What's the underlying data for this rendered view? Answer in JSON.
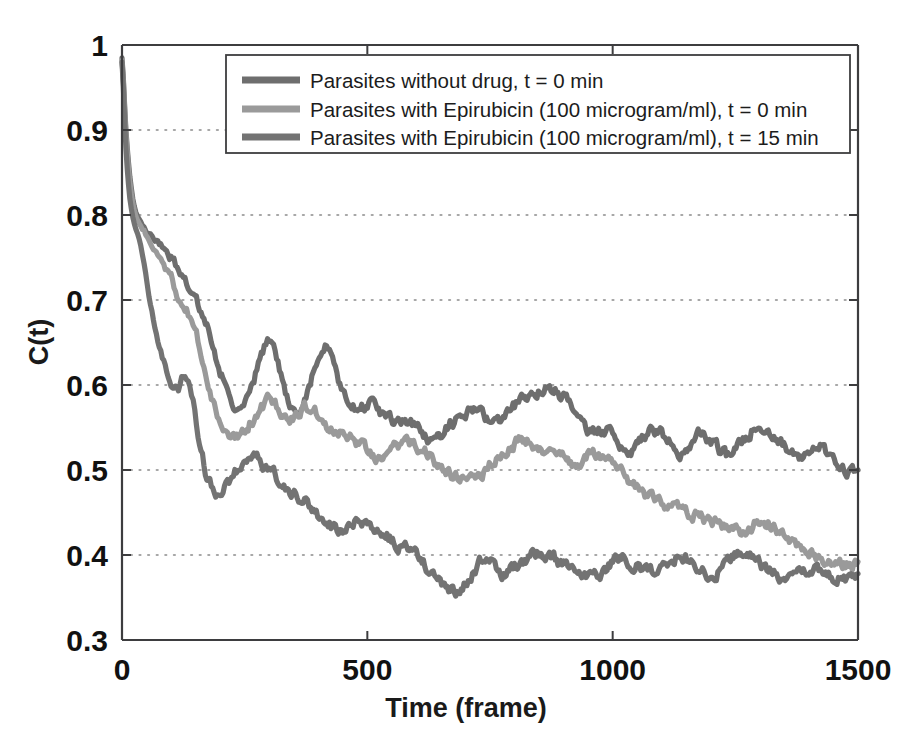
{
  "chart_data": {
    "type": "line",
    "title": "",
    "xlabel": "Time (frame)",
    "ylabel": "C(t)",
    "xlim": [
      0,
      1500
    ],
    "ylim": [
      0.3,
      1.0
    ],
    "xticks": [
      0,
      500,
      1000,
      1500
    ],
    "xtick_labels": [
      "0",
      "500",
      "1000",
      "1500"
    ],
    "yticks": [
      0.3,
      0.4,
      0.5,
      0.6,
      0.7,
      0.8,
      0.9,
      1.0
    ],
    "ytick_labels": [
      "0.3",
      "0.4",
      "0.5",
      "0.6",
      "0.7",
      "0.8",
      "0.9",
      "1"
    ],
    "grid": "horizontal-dotted",
    "legend_position": "top-center",
    "series": [
      {
        "name": "Parasites without drug, t = 0 min",
        "color": "#6e6e6e",
        "x": [
          0,
          8,
          16,
          25,
          35,
          45,
          55,
          70,
          85,
          100,
          115,
          125,
          135,
          145,
          155,
          170,
          185,
          200,
          215,
          230,
          245,
          260,
          275,
          290,
          300,
          315,
          330,
          345,
          360,
          375,
          390,
          405,
          420,
          435,
          450,
          465,
          480,
          500,
          520,
          540,
          560,
          580,
          600,
          620,
          640,
          660,
          680,
          700,
          720,
          740,
          760,
          780,
          800,
          820,
          840,
          860,
          880,
          900,
          920,
          940,
          960,
          980,
          1000,
          1020,
          1040,
          1060,
          1080,
          1100,
          1120,
          1140,
          1160,
          1180,
          1200,
          1220,
          1240,
          1260,
          1280,
          1300,
          1320,
          1340,
          1360,
          1380,
          1400,
          1420,
          1440,
          1460,
          1480,
          1500
        ],
        "y": [
          0.985,
          0.9,
          0.845,
          0.81,
          0.795,
          0.785,
          0.778,
          0.77,
          0.762,
          0.748,
          0.735,
          0.73,
          0.712,
          0.7,
          0.69,
          0.672,
          0.648,
          0.618,
          0.592,
          0.578,
          0.572,
          0.59,
          0.618,
          0.645,
          0.655,
          0.635,
          0.6,
          0.578,
          0.572,
          0.585,
          0.615,
          0.638,
          0.642,
          0.62,
          0.59,
          0.576,
          0.572,
          0.578,
          0.57,
          0.56,
          0.552,
          0.558,
          0.552,
          0.54,
          0.536,
          0.548,
          0.56,
          0.568,
          0.572,
          0.562,
          0.556,
          0.566,
          0.576,
          0.584,
          0.59,
          0.596,
          0.592,
          0.586,
          0.57,
          0.555,
          0.545,
          0.548,
          0.54,
          0.53,
          0.522,
          0.534,
          0.548,
          0.542,
          0.53,
          0.52,
          0.528,
          0.54,
          0.534,
          0.524,
          0.516,
          0.528,
          0.545,
          0.552,
          0.546,
          0.534,
          0.524,
          0.516,
          0.522,
          0.528,
          0.518,
          0.508,
          0.502,
          0.5
        ]
      },
      {
        "name": "Parasites with Epirubicin (100 microgram/ml), t = 0 min",
        "color": "#9a9a9a",
        "x": [
          0,
          8,
          16,
          25,
          35,
          45,
          55,
          70,
          85,
          100,
          115,
          125,
          135,
          145,
          155,
          170,
          185,
          200,
          215,
          230,
          245,
          260,
          275,
          290,
          300,
          315,
          330,
          345,
          360,
          375,
          390,
          405,
          420,
          435,
          450,
          465,
          480,
          500,
          520,
          540,
          560,
          580,
          600,
          620,
          640,
          660,
          680,
          700,
          720,
          740,
          760,
          780,
          800,
          820,
          840,
          860,
          880,
          900,
          920,
          940,
          960,
          980,
          1000,
          1020,
          1040,
          1060,
          1080,
          1100,
          1120,
          1140,
          1160,
          1180,
          1200,
          1220,
          1240,
          1260,
          1280,
          1300,
          1320,
          1340,
          1360,
          1380,
          1400,
          1420,
          1440,
          1460,
          1480,
          1500
        ],
        "y": [
          0.982,
          0.895,
          0.838,
          0.805,
          0.79,
          0.782,
          0.772,
          0.756,
          0.74,
          0.722,
          0.706,
          0.698,
          0.686,
          0.672,
          0.65,
          0.62,
          0.582,
          0.548,
          0.538,
          0.54,
          0.548,
          0.556,
          0.566,
          0.576,
          0.58,
          0.574,
          0.566,
          0.562,
          0.566,
          0.572,
          0.57,
          0.562,
          0.552,
          0.548,
          0.546,
          0.54,
          0.53,
          0.522,
          0.518,
          0.524,
          0.53,
          0.534,
          0.53,
          0.52,
          0.51,
          0.5,
          0.492,
          0.486,
          0.49,
          0.5,
          0.512,
          0.522,
          0.53,
          0.534,
          0.53,
          0.524,
          0.518,
          0.512,
          0.508,
          0.514,
          0.52,
          0.516,
          0.506,
          0.494,
          0.484,
          0.474,
          0.468,
          0.462,
          0.458,
          0.452,
          0.448,
          0.444,
          0.44,
          0.436,
          0.43,
          0.428,
          0.434,
          0.44,
          0.436,
          0.428,
          0.42,
          0.412,
          0.404,
          0.398,
          0.394,
          0.392,
          0.39,
          0.392
        ]
      },
      {
        "name": "Parasites with Epirubicin (100 microgram/ml), t = 15 min",
        "color": "#737373",
        "x": [
          0,
          8,
          16,
          25,
          35,
          45,
          55,
          70,
          85,
          100,
          115,
          125,
          135,
          145,
          155,
          170,
          185,
          200,
          215,
          230,
          245,
          260,
          275,
          290,
          300,
          315,
          330,
          345,
          360,
          375,
          390,
          405,
          420,
          435,
          450,
          465,
          480,
          500,
          520,
          540,
          560,
          580,
          600,
          620,
          640,
          660,
          680,
          700,
          720,
          740,
          760,
          780,
          800,
          820,
          840,
          860,
          880,
          900,
          920,
          940,
          960,
          980,
          1000,
          1020,
          1040,
          1060,
          1080,
          1100,
          1120,
          1140,
          1160,
          1180,
          1200,
          1220,
          1240,
          1260,
          1280,
          1300,
          1320,
          1340,
          1360,
          1380,
          1400,
          1420,
          1440,
          1460,
          1480,
          1500
        ],
        "y": [
          0.98,
          0.878,
          0.82,
          0.79,
          0.772,
          0.742,
          0.7,
          0.66,
          0.628,
          0.608,
          0.6,
          0.61,
          0.604,
          0.58,
          0.545,
          0.5,
          0.48,
          0.472,
          0.482,
          0.498,
          0.508,
          0.516,
          0.512,
          0.504,
          0.498,
          0.49,
          0.482,
          0.474,
          0.468,
          0.462,
          0.452,
          0.444,
          0.438,
          0.432,
          0.43,
          0.434,
          0.438,
          0.436,
          0.428,
          0.422,
          0.414,
          0.406,
          0.398,
          0.386,
          0.372,
          0.362,
          0.358,
          0.366,
          0.382,
          0.394,
          0.386,
          0.378,
          0.386,
          0.394,
          0.4,
          0.402,
          0.396,
          0.388,
          0.38,
          0.374,
          0.372,
          0.378,
          0.39,
          0.396,
          0.392,
          0.384,
          0.378,
          0.384,
          0.392,
          0.398,
          0.392,
          0.384,
          0.378,
          0.386,
          0.396,
          0.402,
          0.398,
          0.39,
          0.382,
          0.376,
          0.372,
          0.378,
          0.386,
          0.382,
          0.376,
          0.372,
          0.374,
          0.378
        ]
      }
    ]
  },
  "legend": {
    "entries": [
      "Parasites without drug, t = 0 min",
      "Parasites with Epirubicin (100 microgram/ml), t = 0 min",
      "Parasites with Epirubicin (100 microgram/ml), t = 15 min"
    ]
  },
  "colors": {
    "background": "#ffffff",
    "axis": "#3d3d3f",
    "grid": "#8a8a8a",
    "text": "#111111",
    "series_1": "#6e6e6e",
    "series_2": "#9a9a9a",
    "series_3": "#737373"
  }
}
